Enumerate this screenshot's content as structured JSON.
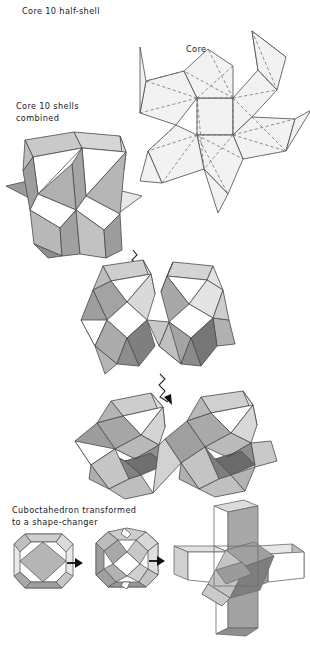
{
  "figure": {
    "domain": "geometric-diagram",
    "background": "#ffffff",
    "stroke": "#4a4a4a",
    "dashed_stroke": "#6b6b6b"
  },
  "labels": {
    "half_shell": "Core 10 half-shell",
    "core": "Core",
    "combined": "Core 10 shells\ncombined",
    "cuboctahedron": "Cuboctahedron transformed\nto a shape-changer"
  },
  "palette": {
    "white": "#ffffff",
    "lightest": "#f2f2f2",
    "light": "#e2e2e2",
    "light_mid": "#d2d2d2",
    "mid": "#bdbdbd",
    "mid_dark": "#a8a8a8",
    "dark": "#909090",
    "darker": "#7a7a7a",
    "darkest": "#636363",
    "outline": "#4a4a4a",
    "arrow": "#111111"
  },
  "icons": {
    "squiggly_arrow": "squiggly-arrow-icon",
    "straight_arrow": "straight-arrow-icon"
  },
  "figures": {
    "net": {
      "name": "core-10-half-shell-net",
      "description": "Pinwheel net: central square with four kite flaps and four outward triangular spikes, fold lines dashed"
    },
    "shell1": {
      "name": "core-10-shells-combined",
      "description": "Two joined prismatic shells with triangular openings"
    },
    "shell2": {
      "name": "shells-stage-two",
      "description": "Two merged rhombic shells with dark interior facets"
    },
    "shell3": {
      "name": "shells-stage-three",
      "description": "Two merged rounded polyhedra with recessed dark core"
    },
    "cubo_a": {
      "name": "cuboctahedron",
      "description": "Cuboctahedron solid"
    },
    "cubo_b": {
      "name": "cuboctahedron-opened",
      "description": "Cuboctahedron with square faces opened"
    },
    "cubo_c": {
      "name": "shape-changer",
      "description": "Cross-shaped shape-changer with inner rotated box"
    }
  },
  "sequence": {
    "steps": [
      "core-10-shells-combined",
      "shells-stage-two",
      "shells-stage-three"
    ],
    "transform_steps": [
      "cuboctahedron",
      "cuboctahedron-opened",
      "shape-changer"
    ]
  }
}
